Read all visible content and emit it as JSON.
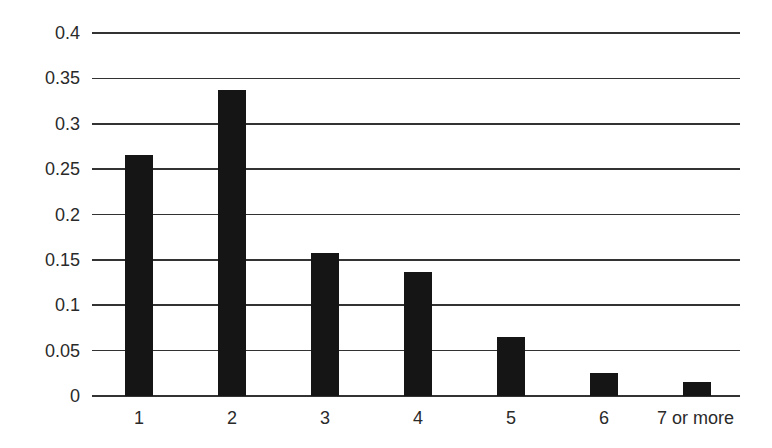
{
  "chart_data": {
    "type": "bar",
    "title": "",
    "xlabel": "",
    "ylabel": "",
    "categories": [
      "1",
      "2",
      "3",
      "4",
      "5",
      "6",
      "7 or more"
    ],
    "values": [
      0.266,
      0.337,
      0.158,
      0.137,
      0.065,
      0.025,
      0.015
    ],
    "ylim": [
      0,
      0.4
    ],
    "yticks": [
      "0",
      "0.05",
      "0.1",
      "0.15",
      "0.2",
      "0.25",
      "0.3",
      "0.35",
      "0.4"
    ],
    "grid": true,
    "legend": null,
    "bar_color": "#151515",
    "grid_color": "#333333"
  }
}
